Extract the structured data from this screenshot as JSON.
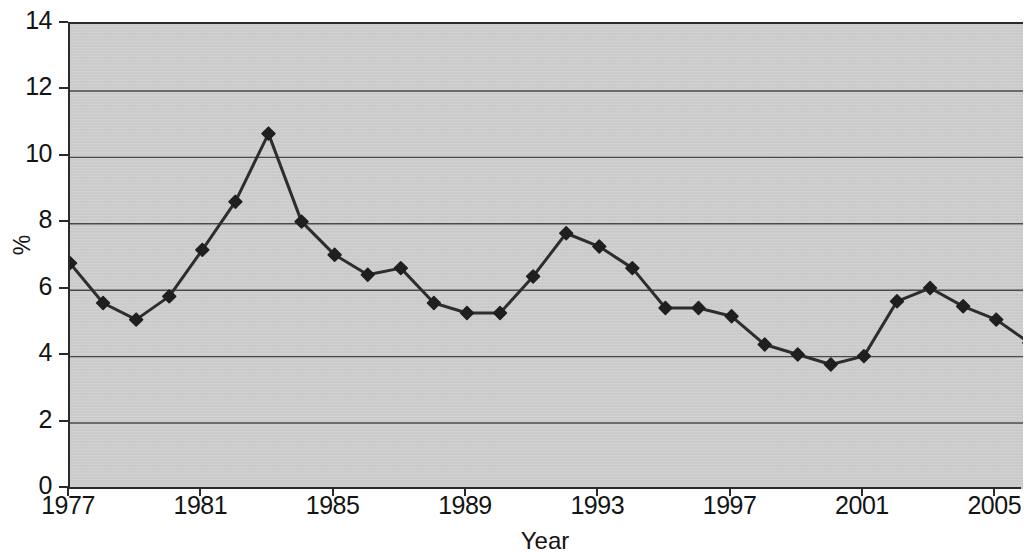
{
  "chart_data": {
    "type": "line",
    "title": "",
    "xlabel": "Year",
    "ylabel": "%",
    "xlim": [
      1977,
      2007.8
    ],
    "ylim": [
      0,
      14
    ],
    "ytick_step": 2,
    "xtick_step": 4,
    "grid": "horizontal",
    "legend": "none",
    "marker": "diamond",
    "line_color": "#2d2d2d",
    "marker_color": "#1f1f1f",
    "plot_background": "#cfcfcf",
    "gridline_color": "#4a4a4a",
    "axis_color": "#2a2a2a",
    "y_ticks": [
      "0",
      "2",
      "4",
      "6",
      "8",
      "10",
      "12",
      "14"
    ],
    "y_tick_values": [
      0,
      2,
      4,
      6,
      8,
      10,
      12,
      14
    ],
    "x_ticks": [
      "1977",
      "1981",
      "1985",
      "1989",
      "1993",
      "1997",
      "2001",
      "2005"
    ],
    "x_tick_values": [
      1977,
      1981,
      1985,
      1989,
      1993,
      1997,
      2001,
      2005
    ],
    "x": [
      1977,
      1978,
      1979,
      1980,
      1981,
      1982,
      1983,
      1984,
      1985,
      1986,
      1987,
      1988,
      1989,
      1990,
      1991,
      1992,
      1993,
      1994,
      1995,
      1996,
      1997,
      1998,
      1999,
      2000,
      2001,
      2002,
      2003,
      2004,
      2005,
      2006,
      2007
    ],
    "values": [
      6.8,
      5.6,
      5.1,
      5.8,
      7.2,
      8.65,
      10.7,
      8.05,
      7.05,
      6.45,
      6.65,
      5.6,
      5.3,
      5.3,
      6.4,
      7.7,
      7.3,
      6.65,
      5.45,
      5.45,
      5.2,
      4.35,
      4.05,
      3.75,
      4.0,
      5.65,
      6.05,
      5.5,
      5.1,
      4.4,
      4.4
    ],
    "series": [
      {
        "name": "",
        "values": [
          6.8,
          5.6,
          5.1,
          5.8,
          7.2,
          8.65,
          10.7,
          8.05,
          7.05,
          6.45,
          6.65,
          5.6,
          5.3,
          5.3,
          6.4,
          7.7,
          7.3,
          6.65,
          5.45,
          5.45,
          5.2,
          4.35,
          4.05,
          3.75,
          4.0,
          5.65,
          6.05,
          5.5,
          5.1,
          4.4,
          4.4
        ]
      }
    ]
  }
}
